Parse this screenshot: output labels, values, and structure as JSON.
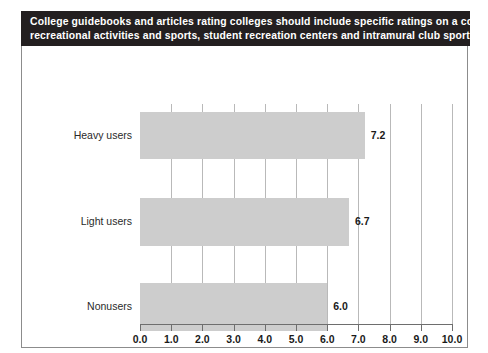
{
  "title": {
    "line1": "College guidebooks and articles rating colleges should include specific ratings on a college's",
    "line2": "recreational activities and sports, student recreation centers and intramural club sports"
  },
  "footnote": "n=2,495",
  "colors": {
    "banner_background": "#231f20",
    "banner_text": "#ffffff",
    "bar_fill": "#cdcdcd",
    "gridline": "#b9b9b9",
    "axis": "#6e6e6e",
    "frame_border": "#8c8c8c"
  },
  "chart_data": {
    "type": "bar",
    "orientation": "horizontal",
    "title": "College guidebooks and articles rating colleges should include specific ratings on a college's recreational activities and sports, student recreation centers and intramural club sports",
    "categories": [
      "Heavy users",
      "Light users",
      "Nonusers"
    ],
    "values": [
      7.2,
      6.7,
      6.0
    ],
    "value_labels": [
      "7.2",
      "6.7",
      "6.0"
    ],
    "xlabel": "",
    "ylabel": "",
    "xlim": [
      0,
      10
    ],
    "xticks": [
      0,
      1,
      2,
      3,
      4,
      5,
      6,
      7,
      8,
      9,
      10
    ],
    "xtick_labels": [
      "0.0",
      "1.0",
      "2.0",
      "3.0",
      "4.0",
      "5.0",
      "6.0",
      "7.0",
      "8.0",
      "9.0",
      "10.0"
    ],
    "grid": true,
    "grid_axis": "x",
    "legend": false,
    "sample_size": "n=2,495"
  }
}
